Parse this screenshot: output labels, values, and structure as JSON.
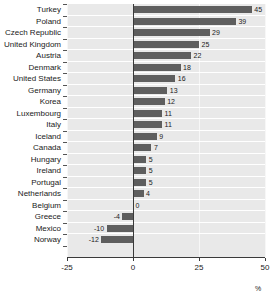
{
  "chart_data": {
    "type": "bar",
    "orientation": "horizontal",
    "title": "",
    "subtitle": "",
    "xlabel": "%",
    "ylabel": "",
    "xlim": [
      -25,
      50
    ],
    "xticks": [
      -25,
      0,
      25,
      50
    ],
    "xticklabels": [
      "-25",
      "0",
      "25",
      "50"
    ],
    "grid": "vertical-light",
    "legend": "none",
    "categories": [
      "Turkey",
      "Poland",
      "Czech Republic",
      "United Kingdom",
      "Austria",
      "Denmark",
      "United States",
      "Germany",
      "Korea",
      "Luxembourg",
      "Italy",
      "Iceland",
      "Canada",
      "Hungary",
      "Ireland",
      "Portugal",
      "Netherlands",
      "Belgium",
      "Greece",
      "Mexico",
      "Norway"
    ],
    "values": [
      45,
      39,
      29,
      25,
      22,
      18,
      16,
      13,
      12,
      11,
      11,
      9,
      7,
      5,
      5,
      5,
      4,
      0,
      -4,
      -10,
      -12
    ],
    "value_labels": [
      "45",
      "39",
      "29",
      "25",
      "22",
      "18",
      "16",
      "13",
      "12",
      "11",
      "11",
      "9",
      "7",
      "5",
      "5",
      "5",
      "4",
      "0",
      "-4",
      "-10",
      "-12"
    ],
    "colors": {
      "bar": "#5e5e5e",
      "plot_background": "#e9e9e9",
      "row_separator": "#ffffff",
      "axis": "#3a3a3a",
      "gridline": "#f7f7f7",
      "text": "#1a1a1a",
      "page_background": "#ffffff"
    }
  }
}
